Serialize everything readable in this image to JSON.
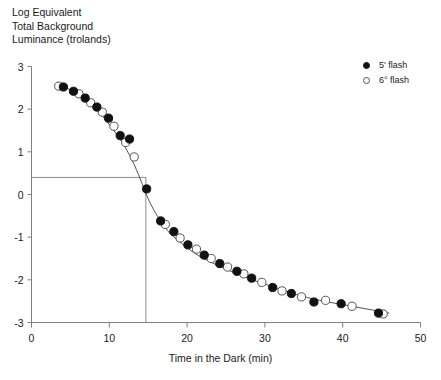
{
  "chart_data": {
    "type": "scatter",
    "title": "Log Equivalent\nTotal Background\nLuminance (trolands)",
    "ylabel": "Log Equivalent Total Background Luminance (trolands)",
    "xlabel": "Time in the Dark (min)",
    "xlim": [
      0,
      50
    ],
    "ylim": [
      -3,
      3
    ],
    "xticks": [
      0,
      10,
      20,
      30,
      40,
      50
    ],
    "yticks": [
      3,
      2,
      1,
      0,
      -1,
      -2,
      -3
    ],
    "grid": false,
    "legend_position": "top-right",
    "legend": [
      "5' flash",
      "6° flash"
    ],
    "annotations": {
      "rod_cone_break_x": 14.7,
      "rod_cone_break_y": 0.4,
      "guide_lines": "horizontal from y-axis to x=14.7 at y=0.4; vertical from y=0.4 down to x-axis at x=14.7"
    },
    "series": [
      {
        "name": "5' flash",
        "marker": "filled-circle",
        "color": "#111111",
        "x": [
          4.1,
          5.4,
          6.9,
          8.4,
          9.9,
          11.4,
          12.6,
          14.8,
          16.6,
          18.3,
          20.1,
          22.2,
          24.2,
          26.4,
          28.3,
          31.0,
          33.4,
          36.3,
          39.8,
          44.6
        ],
        "y": [
          2.52,
          2.42,
          2.26,
          2.05,
          1.79,
          1.38,
          1.3,
          0.13,
          -0.62,
          -0.87,
          -1.18,
          -1.42,
          -1.62,
          -1.8,
          -1.96,
          -2.18,
          -2.32,
          -2.52,
          -2.56,
          -2.78
        ]
      },
      {
        "name": "6° flash",
        "marker": "open-circle",
        "color": "#555555",
        "x": [
          3.5,
          6.1,
          7.6,
          9.1,
          10.6,
          12.1,
          13.2,
          17.2,
          19.1,
          21.2,
          23.1,
          25.2,
          27.3,
          29.6,
          32.2,
          34.7,
          37.8,
          41.2,
          45.2
        ],
        "y": [
          2.54,
          2.36,
          2.15,
          1.93,
          1.6,
          1.22,
          0.88,
          -0.7,
          -1.02,
          -1.28,
          -1.5,
          -1.7,
          -1.86,
          -2.06,
          -2.26,
          -2.4,
          -2.48,
          -2.62,
          -2.8
        ]
      }
    ],
    "fit_curve": {
      "name": "dark adaptation fit",
      "x": [
        3.2,
        4.5,
        6.0,
        7.5,
        9.0,
        10.5,
        12.0,
        13.2,
        14.2,
        15.0,
        16.0,
        17.5,
        19.0,
        21.0,
        23.0,
        25.0,
        27.0,
        29.0,
        31.0,
        34.0,
        37.0,
        40.0,
        43.0,
        46.0
      ],
      "y": [
        2.62,
        2.5,
        2.33,
        2.12,
        1.86,
        1.52,
        1.12,
        0.7,
        0.26,
        -0.1,
        -0.45,
        -0.85,
        -1.1,
        -1.38,
        -1.58,
        -1.75,
        -1.9,
        -2.04,
        -2.16,
        -2.34,
        -2.48,
        -2.58,
        -2.68,
        -2.78
      ]
    }
  },
  "axes": {
    "x_title": "Time in the Dark (min)",
    "y_title_lines": "Log Equivalent\nTotal Background\nLuminance (trolands)"
  },
  "legend": {
    "items": [
      {
        "label": "5' flash",
        "marker": "filled"
      },
      {
        "label": "6° flash",
        "marker": "open"
      }
    ]
  },
  "colors": {
    "axis": "#808080",
    "curve": "#555555",
    "filled_marker": "#111111",
    "open_marker_edge": "#555555",
    "guide_line": "#8a8a8a",
    "text": "#1a1a1a"
  }
}
